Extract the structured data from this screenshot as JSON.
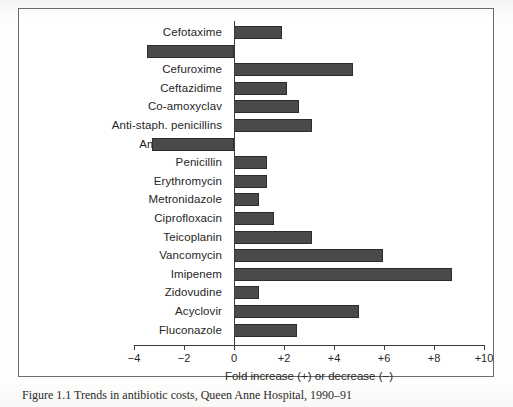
{
  "figure": {
    "caption": "Figure 1.1   Trends in antibiotic costs, Queen Anne Hospital, 1990–91"
  },
  "chart_data": {
    "type": "bar",
    "orientation": "horizontal",
    "title": "",
    "xlabel": "Fold increase (+) or decrease (−)",
    "ylabel": "",
    "xlim": [
      -4,
      10
    ],
    "xticks": [
      -4,
      -2,
      0,
      2,
      4,
      6,
      8,
      10
    ],
    "xtick_labels": [
      "−4",
      "−2",
      "0",
      "+2",
      "+4",
      "+6",
      "+8",
      "+10"
    ],
    "grid": false,
    "legend": null,
    "bar_color": "#4a4a4a",
    "categories": [
      "Cefotaxime",
      "Cephradine",
      "Cefuroxime",
      "Ceftazidime",
      "Co-amoxyclav",
      "Anti-staph. penicillins",
      "Ampicillin/Amox",
      "Penicillin",
      "Erythromycin",
      "Metronidazole",
      "Ciprofloxacin",
      "Teicoplanin",
      "Vancomycin",
      "Imipenem",
      "Zidovudine",
      "Acyclovir",
      "Fluconazole"
    ],
    "values": [
      1.9,
      -3.5,
      4.75,
      2.1,
      2.6,
      3.1,
      -3.3,
      1.3,
      1.3,
      1.0,
      1.6,
      3.1,
      5.95,
      8.7,
      1.0,
      5.0,
      2.5
    ]
  }
}
